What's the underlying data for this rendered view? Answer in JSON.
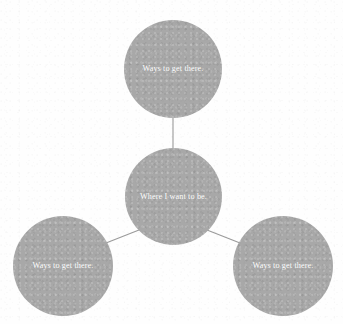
{
  "diagram": {
    "type": "hub-and-spoke-mind-map",
    "background_color": "#ffffff",
    "node_fill_color": "#a8a8a8",
    "node_text_color": "#ffffff",
    "connector_color": "#9a9a9a",
    "center_node": {
      "id": "where-i-want-to-be",
      "label": "Where I want to be.",
      "cx": 173,
      "cy": 196,
      "diameter": 97
    },
    "branch_nodes": [
      {
        "id": "ways-top",
        "label": "Ways to get there.",
        "cx": 173,
        "cy": 69,
        "diameter": 98
      },
      {
        "id": "ways-bottom-left",
        "label": "Ways to get there.",
        "cx": 63,
        "cy": 266,
        "diameter": 100
      },
      {
        "id": "ways-bottom-right",
        "label": "Ways to get there.",
        "cx": 283,
        "cy": 266,
        "diameter": 100
      }
    ],
    "connectors": [
      {
        "id": "center-to-top",
        "x1": 173,
        "y1": 148,
        "x2": 173,
        "y2": 118
      },
      {
        "id": "center-to-bottom-left",
        "x1": 139,
        "y1": 230,
        "x2": 106,
        "y2": 243
      },
      {
        "id": "center-to-bottom-right",
        "x1": 207,
        "y1": 230,
        "x2": 240,
        "y2": 243
      }
    ]
  }
}
